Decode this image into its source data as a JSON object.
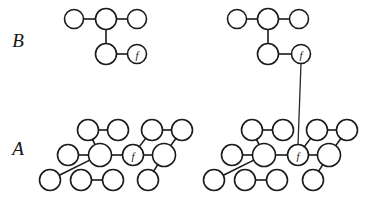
{
  "figure": {
    "background": "#ffffff",
    "stroke_color": "#1a1a1a",
    "width": 372,
    "height": 203,
    "row_labels": {
      "top": "B",
      "bottom": "A"
    },
    "node_marker_label": "f",
    "panels": [
      {
        "id": "left",
        "caption": "",
        "has_interlevel_link": false
      },
      {
        "id": "right",
        "caption": "",
        "has_interlevel_link": true
      }
    ]
  },
  "labels": {
    "B": "B",
    "A": "A",
    "f_top_left": "f",
    "f_top_right": "f",
    "f_bottom_left": "f",
    "f_bottom_right": "f"
  },
  "graphs": {
    "B_left": {
      "name": "coarse-graph-left",
      "nodes": [
        {
          "id": "b1",
          "cx": 74,
          "cy": 19,
          "r": 9.5,
          "label": ""
        },
        {
          "id": "b2",
          "cx": 106,
          "cy": 19,
          "r": 10.5,
          "label": ""
        },
        {
          "id": "b3",
          "cx": 137,
          "cy": 19,
          "r": 9.5,
          "label": ""
        },
        {
          "id": "b4",
          "cx": 106,
          "cy": 54,
          "r": 10.5,
          "label": ""
        },
        {
          "id": "b5",
          "cx": 137,
          "cy": 54,
          "r": 9.5,
          "label": "f"
        }
      ],
      "edges": [
        [
          "b1",
          "b2"
        ],
        [
          "b2",
          "b3"
        ],
        [
          "b2",
          "b4"
        ],
        [
          "b4",
          "b5"
        ]
      ]
    },
    "B_right": {
      "name": "coarse-graph-right",
      "nodes": [
        {
          "id": "b1",
          "cx": 237,
          "cy": 19,
          "r": 9.5,
          "label": ""
        },
        {
          "id": "b2",
          "cx": 268,
          "cy": 19,
          "r": 10.5,
          "label": ""
        },
        {
          "id": "b3",
          "cx": 299,
          "cy": 19,
          "r": 9.5,
          "label": ""
        },
        {
          "id": "b4",
          "cx": 268,
          "cy": 54,
          "r": 10.5,
          "label": ""
        },
        {
          "id": "b5",
          "cx": 301,
          "cy": 54,
          "r": 9.5,
          "label": "f"
        }
      ],
      "edges": [
        [
          "b1",
          "b2"
        ],
        [
          "b2",
          "b3"
        ],
        [
          "b2",
          "b4"
        ],
        [
          "b4",
          "b5"
        ]
      ]
    },
    "A_left": {
      "name": "fine-lattice-left",
      "nodes": [
        {
          "id": "r1c1",
          "cx": 88,
          "cy": 130,
          "r": 10.5,
          "label": ""
        },
        {
          "id": "r1c2",
          "cx": 118,
          "cy": 130,
          "r": 10.5,
          "label": ""
        },
        {
          "id": "r1c3",
          "cx": 152,
          "cy": 130,
          "r": 10.5,
          "label": ""
        },
        {
          "id": "r1c4",
          "cx": 182,
          "cy": 130,
          "r": 10.5,
          "label": ""
        },
        {
          "id": "r2c1",
          "cx": 68,
          "cy": 155,
          "r": 10.5,
          "label": ""
        },
        {
          "id": "r2c2",
          "cx": 100,
          "cy": 155,
          "r": 11.5,
          "label": ""
        },
        {
          "id": "r2c3",
          "cx": 133,
          "cy": 155,
          "r": 10.5,
          "label": "f"
        },
        {
          "id": "r2c4",
          "cx": 164,
          "cy": 155,
          "r": 11.5,
          "label": ""
        },
        {
          "id": "r3c1",
          "cx": 50,
          "cy": 180,
          "r": 10.5,
          "label": ""
        },
        {
          "id": "r3c2",
          "cx": 81,
          "cy": 180,
          "r": 10.5,
          "label": ""
        },
        {
          "id": "r3c3",
          "cx": 113,
          "cy": 180,
          "r": 10.5,
          "label": ""
        },
        {
          "id": "r3c4",
          "cx": 148,
          "cy": 180,
          "r": 10.5,
          "label": ""
        }
      ],
      "edges": [
        [
          "r1c1",
          "r1c2"
        ],
        [
          "r1c3",
          "r1c4"
        ],
        [
          "r2c1",
          "r2c2"
        ],
        [
          "r2c2",
          "r2c3"
        ],
        [
          "r2c3",
          "r2c4"
        ],
        [
          "r3c2",
          "r3c3"
        ],
        [
          "r1c1",
          "r2c2"
        ],
        [
          "r1c3",
          "r2c3"
        ],
        [
          "r2c2",
          "r3c1"
        ],
        [
          "r2c4",
          "r3c4"
        ],
        [
          "r1c4",
          "r2c4"
        ]
      ]
    },
    "A_right": {
      "name": "fine-lattice-right",
      "nodes": [
        {
          "id": "r1c1",
          "cx": 252,
          "cy": 130,
          "r": 10.5,
          "label": ""
        },
        {
          "id": "r1c2",
          "cx": 283,
          "cy": 130,
          "r": 10.5,
          "label": ""
        },
        {
          "id": "r1c3",
          "cx": 317,
          "cy": 130,
          "r": 10.5,
          "label": ""
        },
        {
          "id": "r1c4",
          "cx": 347,
          "cy": 130,
          "r": 10.5,
          "label": ""
        },
        {
          "id": "r2c1",
          "cx": 232,
          "cy": 155,
          "r": 10.5,
          "label": ""
        },
        {
          "id": "r2c2",
          "cx": 264,
          "cy": 155,
          "r": 11.5,
          "label": ""
        },
        {
          "id": "r2c3",
          "cx": 298,
          "cy": 155,
          "r": 10.5,
          "label": "f"
        },
        {
          "id": "r2c4",
          "cx": 329,
          "cy": 155,
          "r": 11.5,
          "label": ""
        },
        {
          "id": "r3c1",
          "cx": 214,
          "cy": 180,
          "r": 10.5,
          "label": ""
        },
        {
          "id": "r3c2",
          "cx": 245,
          "cy": 180,
          "r": 10.5,
          "label": ""
        },
        {
          "id": "r3c3",
          "cx": 277,
          "cy": 180,
          "r": 10.5,
          "label": ""
        },
        {
          "id": "r3c4",
          "cx": 313,
          "cy": 180,
          "r": 10.5,
          "label": ""
        }
      ],
      "edges": [
        [
          "r1c1",
          "r1c2"
        ],
        [
          "r1c3",
          "r1c4"
        ],
        [
          "r2c1",
          "r2c2"
        ],
        [
          "r2c2",
          "r2c3"
        ],
        [
          "r2c3",
          "r2c4"
        ],
        [
          "r3c2",
          "r3c3"
        ],
        [
          "r1c1",
          "r2c2"
        ],
        [
          "r1c3",
          "r2c3"
        ],
        [
          "r2c2",
          "r3c1"
        ],
        [
          "r2c4",
          "r3c4"
        ],
        [
          "r1c4",
          "r2c4"
        ]
      ]
    }
  },
  "interlevel_link": {
    "name": "f-correspondence-line",
    "from": {
      "x": 301,
      "y": 63
    },
    "to": {
      "x": 298,
      "y": 145
    }
  },
  "row_label_positions": {
    "B": {
      "x": 18,
      "y": 40
    },
    "A": {
      "x": 18,
      "y": 148
    }
  }
}
